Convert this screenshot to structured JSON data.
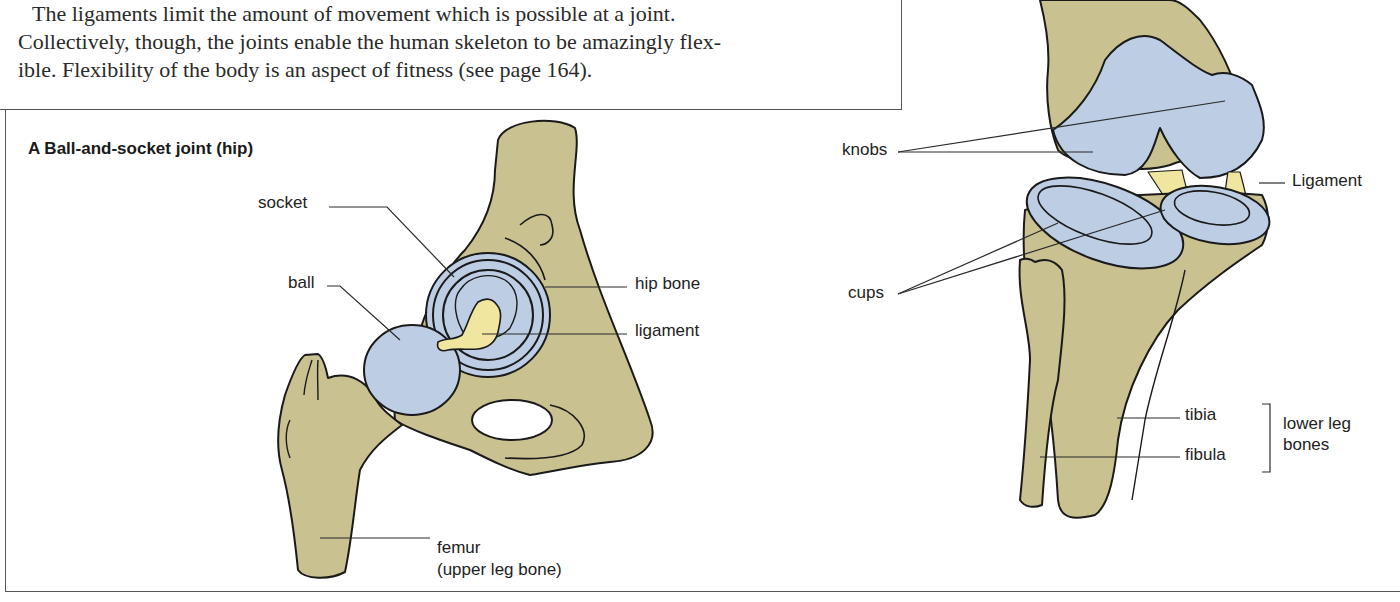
{
  "intro": {
    "lines": [
      "The ligaments limit the amount of movement which is possible at a joint.",
      "Collectively, though, the joints enable the human skeleton to be amazingly flex-",
      "ible. Flexibility of the body is an aspect of fitness (see page 164)."
    ]
  },
  "figure_a": {
    "title": "A  Ball-and-socket joint (hip)",
    "labels": {
      "socket": "socket",
      "ball": "ball",
      "hip_bone": "hip bone",
      "ligament": "ligament",
      "femur": "femur",
      "femur_note": "(upper leg bone)"
    }
  },
  "figure_knee": {
    "labels": {
      "knobs": "knobs",
      "cups": "cups",
      "ligament": "Ligament",
      "tibia": "tibia",
      "fibula": "fibula",
      "group_line1": "lower leg",
      "group_line2": "bones"
    }
  },
  "colors": {
    "bone": "#c9c190",
    "cartilage": "#bccde4",
    "ligament": "#f0e6a0",
    "outline": "#1a1a1a",
    "border": "#555555"
  }
}
